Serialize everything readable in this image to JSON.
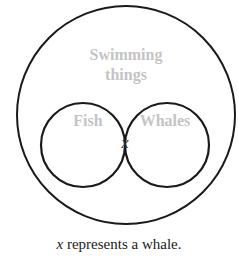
{
  "diagram": {
    "type": "venn",
    "outer_set": {
      "label_line1": "Swimming",
      "label_line2": "things"
    },
    "sets": [
      {
        "label": "Fish"
      },
      {
        "label": "Whales"
      }
    ],
    "intersection_marker": "x",
    "caption": {
      "variable": "x",
      "text": " represents a whale."
    },
    "colors": {
      "stroke": "#1a1a1a",
      "label": "#c4c4c4",
      "text": "#1a1a1a"
    }
  }
}
